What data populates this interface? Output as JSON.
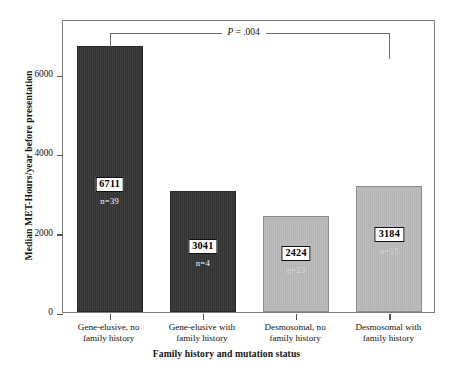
{
  "chart_data": {
    "type": "bar",
    "title": "",
    "xlabel": "Family history and mutation status",
    "ylabel": "Median MET-Hours/year before presentation",
    "categories": [
      "Gene-elusive, no family history",
      "Gene-elusive with family history",
      "Desmosomal, no family history",
      "Desmosomal with family history"
    ],
    "category_lines": [
      [
        "Gene-elusive, no",
        "family history"
      ],
      [
        "Gene-elusive with",
        "family history"
      ],
      [
        "Desmosomal, no",
        "family history"
      ],
      [
        "Desmosomal with",
        "family history"
      ]
    ],
    "values": [
      6711,
      3041,
      2424,
      3184
    ],
    "value_labels": [
      "6711",
      "3041",
      "2424",
      "3184"
    ],
    "n_labels": [
      "n=39",
      "n=4",
      "n=23",
      "n=15"
    ],
    "n_values": [
      39,
      4,
      23,
      15
    ],
    "bar_colors": [
      "#333333",
      "#333333",
      "#b5b5b5",
      "#b5b5b5"
    ],
    "bar_shades": [
      "dark",
      "dark",
      "light",
      "light"
    ],
    "ylim": [
      0,
      7392
    ],
    "yticks": [
      0,
      2000,
      4000,
      6000
    ],
    "ytick_labels": [
      "0",
      "2000",
      "4000",
      "6000"
    ],
    "grid": false,
    "legend": "none",
    "annotations": [
      {
        "name": "significance-bracket",
        "text_prefix": "P",
        "text_suffix": " = .004",
        "text": "P = .004",
        "from_category": "Gene-elusive, no family history",
        "to_category": "Desmosomal with family history",
        "p_value": 0.004
      }
    ]
  },
  "axes": {
    "y_title": "Median MET-Hours/year before presentation",
    "x_title": "Family history and mutation status"
  }
}
